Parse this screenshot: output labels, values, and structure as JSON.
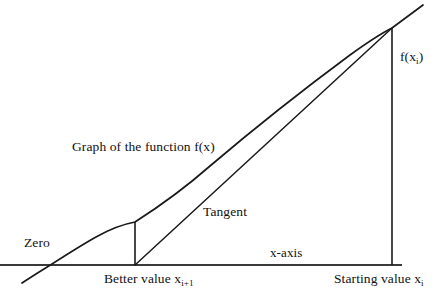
{
  "figure": {
    "background_color": "#ffffff",
    "stroke_color": "#1a1a1a",
    "axis_color": "#333333",
    "labels": {
      "zero": "Zero",
      "graph_of_function": "Graph of the function f(x)",
      "tangent": "Tangent",
      "x_axis": "x-axis",
      "f_of_xi_main": "f(x",
      "f_of_xi_sub": "i",
      "f_of_xi_tail": ")",
      "better_value_main": "Better value x",
      "better_value_sub": "i+1",
      "starting_value_main": "Starting value x",
      "starting_value_sub": "i"
    },
    "geometry": {
      "x_axis": {
        "x1": 0,
        "y1": 265,
        "x2": 402,
        "y2": 265,
        "width": 2
      },
      "curve": {
        "description": "Graph of f(x), slightly concave-up curve rising left to right",
        "points": [
          [
            22,
            283
          ],
          [
            40,
            271
          ],
          [
            52,
            264
          ],
          [
            70,
            253
          ],
          [
            90,
            241
          ],
          [
            110,
            231
          ],
          [
            135,
            222
          ],
          [
            165,
            202
          ],
          [
            200,
            177
          ],
          [
            240,
            144
          ],
          [
            280,
            111
          ],
          [
            320,
            79
          ],
          [
            360,
            48
          ],
          [
            392,
            28
          ],
          [
            423,
            5
          ]
        ]
      },
      "tangent": {
        "description": "Tangent line from the root of the tangent at the better value to the point on the curve at the starting value",
        "x1": 135,
        "y1": 265,
        "x2": 392,
        "y2": 28
      },
      "vertical_better_value": {
        "x": 135,
        "y1": 222,
        "y2": 265,
        "width": 1.6
      },
      "vertical_starting_value": {
        "x": 392,
        "y1": 28,
        "y2": 265,
        "width": 1.6
      }
    }
  }
}
